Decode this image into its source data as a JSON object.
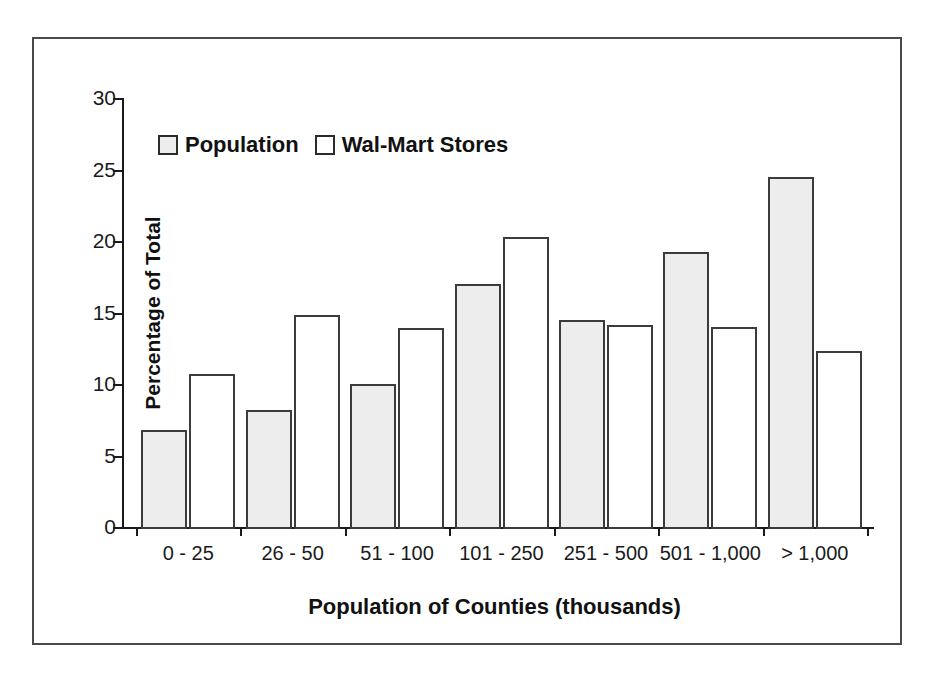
{
  "chart_data": {
    "type": "bar",
    "title": "",
    "subtitle": "",
    "xlabel": "Population of Counties (thousands)",
    "ylabel": "Percentage of Total",
    "categories": [
      "0 - 25",
      "26 - 50",
      "51 - 100",
      "101 - 250",
      "251 - 500",
      "501 - 1,000",
      "> 1,000"
    ],
    "series": [
      {
        "name": "Population",
        "values": [
          6.8,
          8.2,
          10.0,
          17.0,
          14.5,
          19.2,
          24.5
        ]
      },
      {
        "name": "Wal-Mart Stores",
        "values": [
          10.7,
          14.8,
          13.9,
          20.3,
          14.1,
          14.0,
          12.3
        ]
      }
    ],
    "ylim": [
      0,
      30
    ],
    "ytick_values": [
      0,
      5,
      10,
      15,
      20,
      25,
      30
    ],
    "ytick_labels": [
      "0",
      "5",
      "10",
      "15",
      "20",
      "25",
      "30"
    ],
    "grid": false,
    "legend_position": "top-left-inside"
  },
  "legend": {
    "items": [
      {
        "label": "Population",
        "swatch": "light-gray-filled-square"
      },
      {
        "label": "Wal-Mart Stores",
        "swatch": "white-filled-square"
      }
    ]
  },
  "colors": {
    "population_fill": "#ededed",
    "walmart_fill": "#ffffff",
    "bar_outline": "#3b3b3b",
    "axis": "#1a1a1a",
    "frame": "#4a4a4a",
    "text": "#111111",
    "background": "#ffffff"
  }
}
